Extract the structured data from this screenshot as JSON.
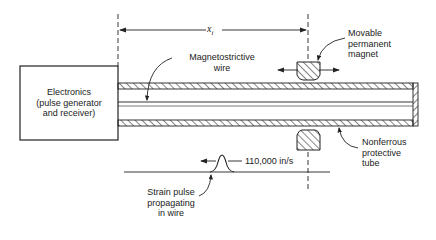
{
  "diagram": {
    "type": "magnetostrictive position sensor schematic",
    "electronics_box": {
      "line1": "Electronics",
      "line2": "(pulse generator",
      "line3": "and receiver)"
    },
    "dimension_label": "x",
    "dimension_subscript": "i",
    "labels": {
      "wire_line1": "Magnetostrictive",
      "wire_line2": "wire",
      "magnet_line1": "Movable",
      "magnet_line2": "permanent",
      "magnet_line3": "magnet",
      "tube_line1": "Nonferrous",
      "tube_line2": "protective",
      "tube_line3": "tube",
      "speed": "110,000 in/s",
      "pulse_line1": "Strain pulse",
      "pulse_line2": "propagating",
      "pulse_line3": "in wire"
    },
    "colors": {
      "line": "#222222",
      "background": "#ffffff"
    }
  }
}
